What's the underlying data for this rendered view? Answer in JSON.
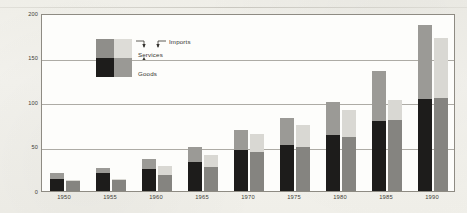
{
  "figure": {
    "title_ghost": "",
    "watermark_text": "",
    "background_color": "#f2f1ec",
    "plot_background_color": "#fdfdfb",
    "frame_color": "#8e8b83"
  },
  "legend": {
    "exports_label": "Exports",
    "imports_label": "Imports",
    "services_label": "Services",
    "goods_label": "Goods",
    "swatch_colors": {
      "exports_services": "#8f8e8a",
      "imports_services": "#dddcd7",
      "exports_goods": "#1d1c1b",
      "imports_goods": "#9a9995"
    }
  },
  "chart_data": {
    "type": "bar",
    "title": "",
    "xlabel": "",
    "ylabel": "Billions of 1972 Dollars",
    "ylim": [
      0,
      200
    ],
    "yticks": [
      0,
      50,
      100,
      150,
      200
    ],
    "ytick_labels": [
      "0",
      "50",
      "100",
      "150",
      "200"
    ],
    "grid": true,
    "grid_axis": "y",
    "legend_position": "inside-upper-left",
    "stacked": true,
    "grouped": true,
    "group_labels": [
      "Exports",
      "Imports"
    ],
    "stack_labels": [
      "Goods",
      "Services"
    ],
    "categories": [
      "1950",
      "1955",
      "1960",
      "1965",
      "1970",
      "1975",
      "1980",
      "1985",
      "1990"
    ],
    "series": [
      {
        "name": "Exports - Goods",
        "group": "Exports",
        "stack": "Goods",
        "color": "#1d1c1b",
        "values": [
          14,
          20,
          25,
          33,
          46,
          52,
          63,
          79,
          103
        ]
      },
      {
        "name": "Exports - Services",
        "group": "Exports",
        "stack": "Services",
        "color": "#9b9a96",
        "values": [
          6,
          6,
          11,
          16,
          23,
          30,
          37,
          56,
          84
        ]
      },
      {
        "name": "Imports - Goods",
        "group": "Imports",
        "stack": "Goods",
        "color": "#858480",
        "values": [
          11,
          12,
          18,
          27,
          44,
          50,
          61,
          80,
          105
        ]
      },
      {
        "name": "Imports - Services",
        "group": "Imports",
        "stack": "Services",
        "color": "#d9d8d3",
        "values": [
          1,
          2,
          10,
          13,
          20,
          24,
          30,
          22,
          67
        ]
      }
    ],
    "totals": {
      "exports": [
        20,
        26,
        36,
        49,
        69,
        82,
        100,
        135,
        187
      ],
      "imports": [
        12,
        14,
        28,
        40,
        64,
        74,
        91,
        102,
        172
      ]
    }
  }
}
